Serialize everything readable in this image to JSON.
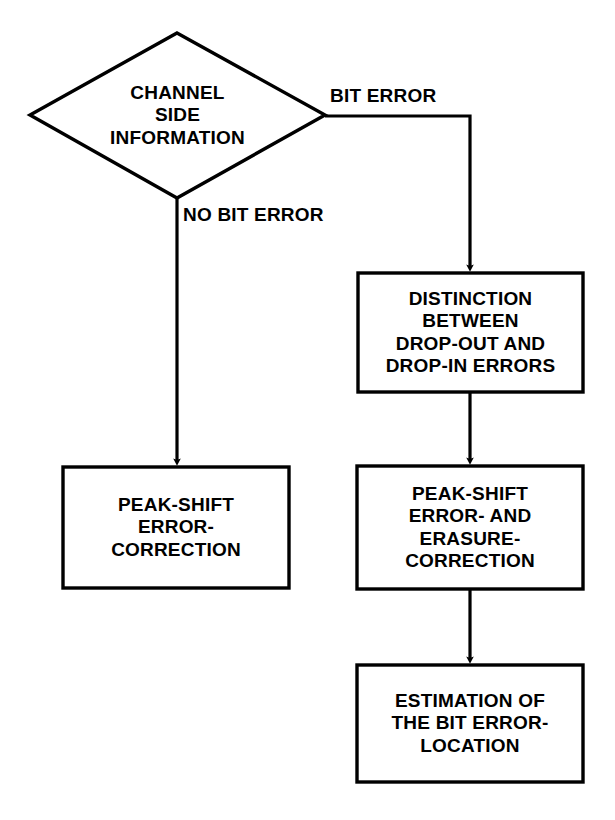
{
  "diagram": {
    "background_color": "#ffffff",
    "stroke_color": "#000000",
    "decision": {
      "id": "channel-side-information",
      "shape": "diamond",
      "lines": [
        "CHANNEL",
        "SIDE",
        "INFORMATION"
      ]
    },
    "edge_labels": {
      "bit_error": "BIT ERROR",
      "no_bit_error": "NO BIT ERROR"
    },
    "boxes": {
      "left_peak_shift": {
        "id": "peak-shift-error-correction",
        "shape": "rectangle",
        "lines": [
          "PEAK-SHIFT",
          "ERROR-",
          "CORRECTION"
        ]
      },
      "right_distinction": {
        "id": "distinction-drop-out-drop-in",
        "shape": "rectangle",
        "lines": [
          "DISTINCTION",
          "BETWEEN",
          "DROP-OUT AND",
          "DROP-IN ERRORS"
        ]
      },
      "right_peak_shift_erasure": {
        "id": "peak-shift-error-and-erasure-correction",
        "shape": "rectangle",
        "lines": [
          "PEAK-SHIFT",
          "ERROR- AND",
          "ERASURE-",
          "CORRECTION"
        ]
      },
      "right_estimation": {
        "id": "estimation-of-bit-error-location",
        "shape": "rectangle",
        "lines": [
          "ESTIMATION OF",
          "THE BIT ERROR-",
          "LOCATION"
        ]
      }
    }
  }
}
